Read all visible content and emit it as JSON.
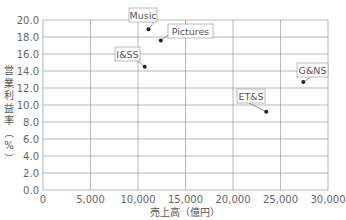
{
  "chart_data": {
    "type": "scatter",
    "title": "",
    "xlabel": "売上高（億円）",
    "ylabel": "営業利益率（%）",
    "xlim": [
      0,
      30000
    ],
    "ylim": [
      0,
      20
    ],
    "x_ticks": [
      "0",
      "5,000",
      "10,000",
      "15,000",
      "20,000",
      "25,000",
      "30,000"
    ],
    "y_ticks": [
      "0.0",
      "2.0",
      "4.0",
      "6.0",
      "8.0",
      "10.0",
      "12.0",
      "14.0",
      "16.0",
      "18.0",
      "20.0"
    ],
    "grid": true,
    "legend": "none",
    "points": [
      {
        "label": "Music",
        "x": 11100,
        "y": 18.9
      },
      {
        "label": "Pictures",
        "x": 12400,
        "y": 17.6
      },
      {
        "label": "I&SS",
        "x": 10700,
        "y": 14.5
      },
      {
        "label": "G&NS",
        "x": 27400,
        "y": 12.7
      },
      {
        "label": "ET&S",
        "x": 23500,
        "y": 9.2
      }
    ],
    "label_boxes": [
      {
        "label": "Music",
        "x": 129,
        "y": 8,
        "w": 28,
        "h": 14
      },
      {
        "label": "Pictures",
        "x": 168,
        "y": 24,
        "w": 45,
        "h": 14
      },
      {
        "label": "I&SS",
        "x": 115,
        "y": 47,
        "w": 25,
        "h": 14
      },
      {
        "label": "G&NS",
        "x": 297,
        "y": 63,
        "w": 31,
        "h": 14
      },
      {
        "label": "ET&S",
        "x": 237,
        "y": 89,
        "w": 28,
        "h": 14
      }
    ]
  },
  "layout": {
    "plot_left": 43,
    "plot_right": 328,
    "plot_top": 20,
    "plot_bottom": 190,
    "grid_color": "#9a9a9a",
    "point_color": "#222222",
    "box_border": "#aaaaaa"
  }
}
